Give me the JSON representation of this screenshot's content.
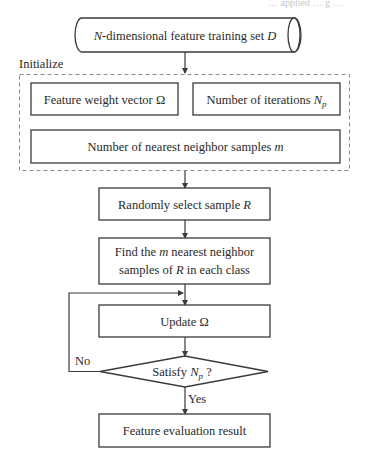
{
  "header_fragment": "… applied … g …",
  "flowchart": {
    "input": {
      "prefix_italic": "N",
      "text": "-dimensional feature training set ",
      "suffix_italic": "D"
    },
    "init_group_label": "Initialize",
    "init_boxes": {
      "weight_vector": {
        "text": "Feature weight vector Ω"
      },
      "iterations": {
        "text": "Number of iterations ",
        "symbol": "N",
        "subscript": "p"
      },
      "neighbors": {
        "text": "Number of nearest neighbor samples ",
        "symbol": "m"
      }
    },
    "steps": {
      "random_select": {
        "text": "Randomly select sample ",
        "symbol": "R"
      },
      "find_neighbors": {
        "line1_pre": "Find the ",
        "line1_sym": "m",
        "line1_post": " nearest neighbor",
        "line2_pre": "samples of ",
        "line2_sym": "R",
        "line2_post": " in each class"
      },
      "update": {
        "text": "Update Ω"
      },
      "decision": {
        "text": "Satisfy ",
        "symbol": "N",
        "subscript": "p",
        "suffix": " ?"
      },
      "result": {
        "text": "Feature evaluation result"
      }
    },
    "edge_labels": {
      "no": "No",
      "yes": "Yes"
    }
  },
  "colors": {
    "stroke": "#3a3a3a",
    "dash": "#8a8a8a",
    "text": "#2a2a2a",
    "background": "#ffffff"
  }
}
